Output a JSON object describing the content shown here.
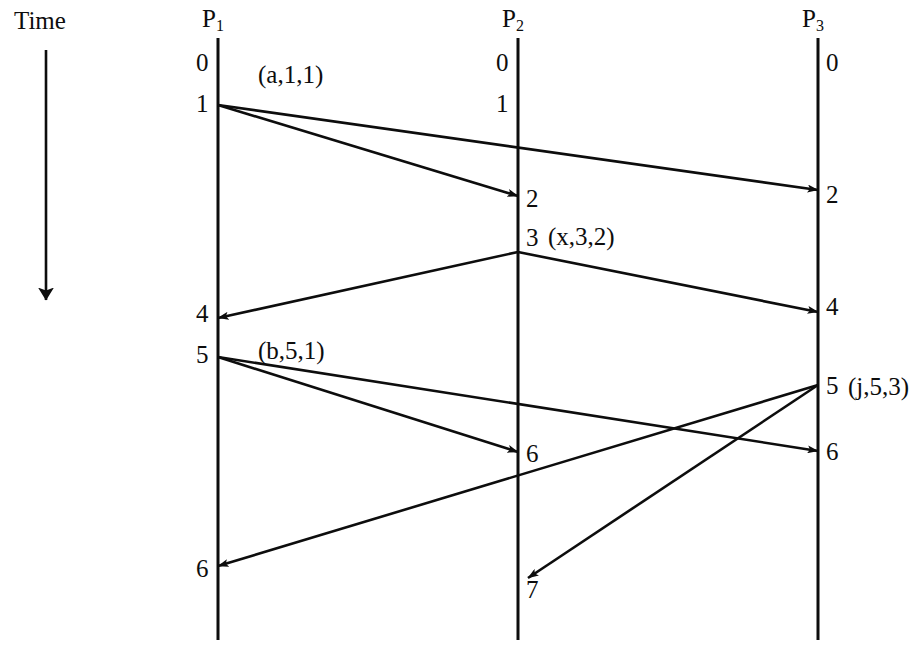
{
  "diagram": {
    "title_label": "Time",
    "type": "lamport-vector-clock-spacetime-diagram",
    "ink_color": "#0d0d0d",
    "background": "#ffffff",
    "time_axis": {
      "label": "Time",
      "direction": "downward",
      "arrow_icon": "down-arrow-icon"
    },
    "processes": [
      {
        "id": "P1",
        "name_base": "P",
        "name_sub": "1",
        "x": 218,
        "events": [
          {
            "label": "0",
            "y": 64
          },
          {
            "label": "1",
            "y": 105
          },
          {
            "label": "4",
            "y": 315
          },
          {
            "label": "5",
            "y": 356
          },
          {
            "label": "6",
            "y": 570
          }
        ]
      },
      {
        "id": "P2",
        "name_base": "P",
        "name_sub": "2",
        "x": 518,
        "events": [
          {
            "label": "0",
            "y": 64
          },
          {
            "label": "1",
            "y": 105
          },
          {
            "label": "2",
            "y": 200
          },
          {
            "label": "3",
            "y": 239
          },
          {
            "label": "6",
            "y": 455
          },
          {
            "label": "7",
            "y": 591
          }
        ]
      },
      {
        "id": "P3",
        "name_base": "P",
        "name_sub": "3",
        "x": 818,
        "events": [
          {
            "label": "0",
            "y": 64
          },
          {
            "label": "2",
            "y": 196
          },
          {
            "label": "4",
            "y": 308
          },
          {
            "label": "5",
            "y": 387
          },
          {
            "label": "6",
            "y": 453
          }
        ]
      }
    ],
    "message_labels": [
      {
        "text": "(a,1,1)",
        "x": 258,
        "y": 62
      },
      {
        "text": "(x,3,2)",
        "x": 548,
        "y": 224
      },
      {
        "text": "(b,5,1)",
        "x": 258,
        "y": 338
      },
      {
        "text": "(j,5,3)",
        "x": 848,
        "y": 374
      }
    ],
    "messages": [
      {
        "name": "a-to-P2",
        "from": "P1",
        "to": "P2",
        "x1": 218,
        "y1": 105,
        "x2": 518,
        "y2": 196
      },
      {
        "name": "a-to-P3",
        "from": "P1",
        "to": "P3",
        "x1": 218,
        "y1": 105,
        "x2": 818,
        "y2": 190
      },
      {
        "name": "x-to-P1",
        "from": "P2",
        "to": "P1",
        "x1": 518,
        "y1": 252,
        "x2": 218,
        "y2": 318
      },
      {
        "name": "x-to-P3",
        "from": "P2",
        "to": "P3",
        "x1": 518,
        "y1": 252,
        "x2": 818,
        "y2": 312
      },
      {
        "name": "b-to-P2",
        "from": "P1",
        "to": "P2",
        "x1": 218,
        "y1": 357,
        "x2": 518,
        "y2": 452
      },
      {
        "name": "b-to-P3",
        "from": "P1",
        "to": "P3",
        "x1": 218,
        "y1": 357,
        "x2": 818,
        "y2": 451
      },
      {
        "name": "j-to-P1",
        "from": "P3",
        "to": "P1",
        "x1": 818,
        "y1": 385,
        "x2": 218,
        "y2": 566
      },
      {
        "name": "j-to-P2",
        "from": "P3",
        "to": "P2",
        "x1": 818,
        "y1": 385,
        "x2": 528,
        "y2": 578
      }
    ],
    "timeline": {
      "x": 46,
      "y_top": 50,
      "y_bottom": 300
    },
    "process_line": {
      "y_top": 38,
      "y_bottom": 640
    },
    "process_header_y": 18
  }
}
